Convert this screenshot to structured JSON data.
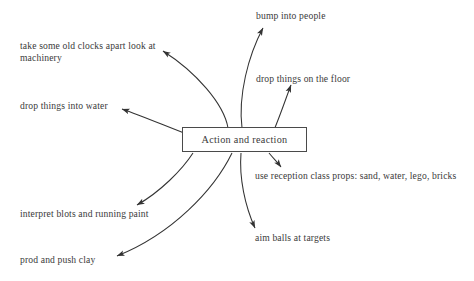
{
  "diagram": {
    "title": "Action and reaction",
    "center": {
      "label": "Action and reaction",
      "shape": "rectangle",
      "stroke_color": "#4a4a4a",
      "fill_color": "#ffffff"
    },
    "background_color": "#ffffff",
    "text_color": "#3a3a3a",
    "arrow_color": "#333333",
    "nodes": [
      {
        "id": "clocks",
        "label": "take some old clocks apart look at machinery",
        "position": "top-left"
      },
      {
        "id": "water",
        "label": "drop things into water",
        "position": "left-upper"
      },
      {
        "id": "bump",
        "label": "bump into people",
        "position": "top-right"
      },
      {
        "id": "floor",
        "label": "drop things on the floor",
        "position": "right-upper"
      },
      {
        "id": "props",
        "label": "use reception class props: sand, water, lego, bricks",
        "position": "right-lower"
      },
      {
        "id": "aim",
        "label": "aim balls at targets",
        "position": "bottom-right"
      },
      {
        "id": "blots",
        "label": "interpret blots and running paint",
        "position": "bottom-left"
      },
      {
        "id": "clay",
        "label": "prod and push clay",
        "position": "bottom-left-lower"
      }
    ]
  }
}
